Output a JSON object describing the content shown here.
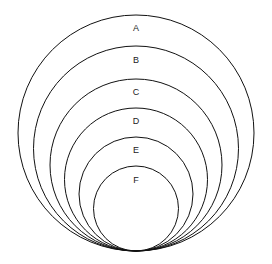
{
  "diagram": {
    "type": "nested tangent circles",
    "circles": [
      {
        "label": "A",
        "cx": 136,
        "cy": 133,
        "r": 118,
        "label_y": 31
      },
      {
        "label": "B",
        "cx": 136,
        "cy": 148.5,
        "r": 102.5,
        "label_y": 63
      },
      {
        "label": "C",
        "cx": 136,
        "cy": 165,
        "r": 86,
        "label_y": 95
      },
      {
        "label": "D",
        "cx": 136,
        "cy": 179.5,
        "r": 71.5,
        "label_y": 124
      },
      {
        "label": "E",
        "cx": 136,
        "cy": 194,
        "r": 57,
        "label_y": 153
      },
      {
        "label": "F",
        "cx": 136,
        "cy": 208.5,
        "r": 42.5,
        "label_y": 183
      }
    ]
  }
}
